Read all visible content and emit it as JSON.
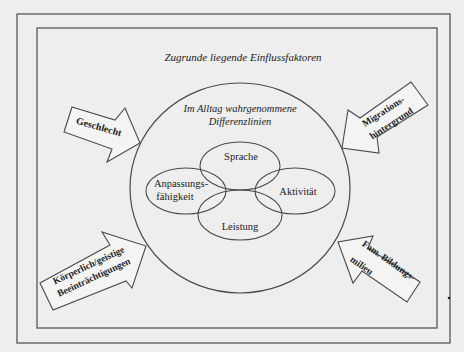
{
  "diagram": {
    "title": "Zugrunde liegende Einflussfaktoren",
    "inner_circle": {
      "title_line1": "Im Alltag wahrgenommene",
      "title_line2": "Differenzlinien"
    },
    "ellipses": [
      {
        "label_line1": "Sprache",
        "label_line2": ""
      },
      {
        "label_line1": "Anpassungs-",
        "label_line2": "fähigkeit"
      },
      {
        "label_line1": "Aktivität",
        "label_line2": ""
      },
      {
        "label_line1": "Leistung",
        "label_line2": ""
      }
    ],
    "arrows": [
      {
        "label_line1": "Geschlecht",
        "label_line2": ""
      },
      {
        "label_line1": "Migrations-",
        "label_line2": "hintergrund"
      },
      {
        "label_line1": "Körperlich/geistige",
        "label_line2": "Beeinträchtigungen"
      },
      {
        "label_line1": "Fam. Bildungs-",
        "label_line2": "milieu"
      }
    ],
    "colors": {
      "background": "#eeeeee",
      "stroke": "#4a4a4a",
      "text": "#222222",
      "arrow_fill": "#f4f4f4"
    }
  }
}
